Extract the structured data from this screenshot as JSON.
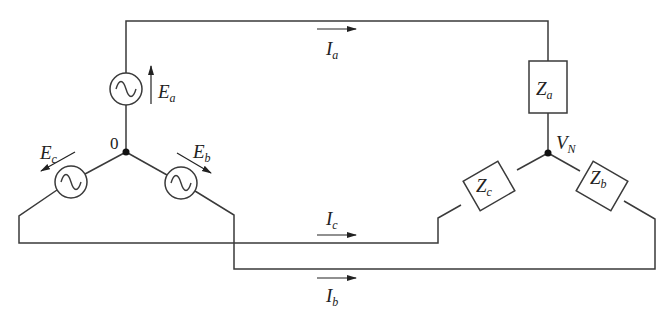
{
  "diagram": {
    "type": "three-phase wye-wye circuit",
    "colors": {
      "line": "#3a3a3a",
      "node": "#111111",
      "background": "#ffffff"
    },
    "sources": [
      {
        "id": "Ea",
        "symbol": "E",
        "subscript": "a",
        "icon": "ac-source-icon"
      },
      {
        "id": "Eb",
        "symbol": "E",
        "subscript": "b",
        "icon": "ac-source-icon"
      },
      {
        "id": "Ec",
        "symbol": "E",
        "subscript": "c",
        "icon": "ac-source-icon"
      }
    ],
    "loads": [
      {
        "id": "Za",
        "symbol": "Z",
        "subscript": "a"
      },
      {
        "id": "Zb",
        "symbol": "Z",
        "subscript": "b"
      },
      {
        "id": "Zc",
        "symbol": "Z",
        "subscript": "c"
      }
    ],
    "currents": [
      {
        "id": "Ia",
        "symbol": "I",
        "subscript": "a"
      },
      {
        "id": "Ib",
        "symbol": "I",
        "subscript": "b"
      },
      {
        "id": "Ic",
        "symbol": "I",
        "subscript": "c"
      }
    ],
    "nodes": {
      "source_neutral": {
        "label": "0"
      },
      "load_neutral": {
        "symbol": "V",
        "subscript": "N"
      }
    }
  }
}
